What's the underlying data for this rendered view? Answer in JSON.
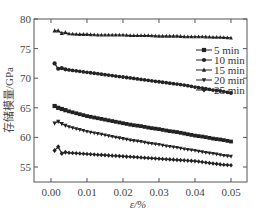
{
  "chart_data": {
    "type": "line",
    "title": "",
    "xlabel": "ε/%",
    "ylabel": "存储模量/GPa",
    "xlim": [
      -0.005,
      0.0545
    ],
    "ylim": [
      52.5,
      80
    ],
    "xticks": [
      0.0,
      0.01,
      0.02,
      0.03,
      0.04,
      0.05
    ],
    "xtick_labels": [
      "0.00",
      "0.01",
      "0.02",
      "0.03",
      "0.04",
      "0.05"
    ],
    "yticks": [
      55,
      60,
      65,
      70,
      75,
      80
    ],
    "ytick_labels": [
      "55",
      "60",
      "65",
      "70",
      "75",
      "80"
    ],
    "grid": false,
    "legend_position": "upper right",
    "x": [
      0.001,
      0.002,
      0.003,
      0.004,
      0.005,
      0.0075,
      0.01,
      0.0125,
      0.015,
      0.0175,
      0.02,
      0.0225,
      0.025,
      0.0275,
      0.03,
      0.0325,
      0.035,
      0.0375,
      0.04,
      0.0425,
      0.045,
      0.0475,
      0.05
    ],
    "series": [
      {
        "name": "5 min",
        "marker": "square",
        "values": [
          65.3,
          65.0,
          64.8,
          64.6,
          64.4,
          64.0,
          63.6,
          63.3,
          63.0,
          62.7,
          62.4,
          62.1,
          61.9,
          61.6,
          61.4,
          61.1,
          60.9,
          60.6,
          60.3,
          60.1,
          59.8,
          59.6,
          59.3
        ]
      },
      {
        "name": "10 min",
        "marker": "circle",
        "values": [
          72.5,
          71.6,
          71.7,
          71.5,
          71.4,
          71.2,
          71.0,
          70.8,
          70.6,
          70.4,
          70.2,
          70.0,
          69.8,
          69.6,
          69.4,
          69.2,
          69.0,
          68.8,
          68.5,
          68.3,
          68.0,
          67.8,
          67.5
        ]
      },
      {
        "name": "15 min",
        "marker": "triangle-up",
        "values": [
          78.0,
          78.0,
          77.6,
          77.7,
          77.5,
          77.4,
          77.4,
          77.3,
          77.3,
          77.3,
          77.3,
          77.2,
          77.2,
          77.2,
          77.1,
          77.1,
          77.1,
          77.0,
          77.0,
          77.0,
          76.9,
          76.9,
          76.8
        ]
      },
      {
        "name": "20 min",
        "marker": "triangle-down",
        "values": [
          62.4,
          62.7,
          62.3,
          62.0,
          61.8,
          61.4,
          61.0,
          60.7,
          60.4,
          60.1,
          59.8,
          59.5,
          59.3,
          59.0,
          58.8,
          58.5,
          58.3,
          58.0,
          57.8,
          57.5,
          57.3,
          57.0,
          56.8
        ]
      },
      {
        "name": "25 min",
        "marker": "diamond",
        "values": [
          57.8,
          58.4,
          57.3,
          57.5,
          57.4,
          57.3,
          57.2,
          57.1,
          57.0,
          56.9,
          56.8,
          56.7,
          56.6,
          56.5,
          56.4,
          56.3,
          56.2,
          56.1,
          56.0,
          55.8,
          55.6,
          55.4,
          55.3
        ]
      }
    ]
  },
  "legend": {
    "items": [
      {
        "label": "5 min",
        "marker": "square"
      },
      {
        "label": "10 min",
        "marker": "circle"
      },
      {
        "label": "15 min",
        "marker": "triangle-up"
      },
      {
        "label": "20 min",
        "marker": "triangle-down"
      },
      {
        "label": "25 min",
        "marker": "diamond"
      }
    ]
  },
  "colors": {
    "series": "#222222",
    "axis": "#555555",
    "text": "#444444"
  }
}
